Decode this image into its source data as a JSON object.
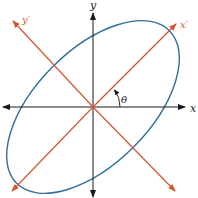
{
  "diagram": {
    "type": "rotated-axes-ellipse",
    "labels": {
      "x": "x",
      "y": "y",
      "x_prime": "x′",
      "y_prime": "y′",
      "angle": "θ"
    },
    "colors": {
      "axes": "#1a1a1a",
      "rotated_axes": "#d4552f",
      "ellipse": "#2e6f9e",
      "angle_arrow": "#1a1a1a"
    },
    "rotation_degrees": 45
  }
}
